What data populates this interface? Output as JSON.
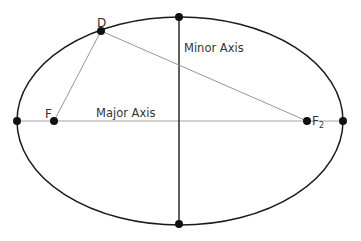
{
  "diagram": {
    "type": "ellipse-geometry",
    "ellipse": {
      "cx": 180,
      "cy": 121,
      "rx": 163,
      "ry": 104,
      "stroke": "#1a1a1a"
    },
    "axes": {
      "major": {
        "label": "Major Axis",
        "x1": 17,
        "y1": 121,
        "x2": 343,
        "y2": 121,
        "stroke": "#999999"
      },
      "minor": {
        "label": "Minor Axis",
        "x1": 179,
        "y1": 17,
        "x2": 179,
        "y2": 224,
        "stroke": "#1a1a1a"
      }
    },
    "points": [
      {
        "id": "vertex-left",
        "x": 17,
        "y": 121,
        "label": ""
      },
      {
        "id": "vertex-right",
        "x": 343,
        "y": 121,
        "label": ""
      },
      {
        "id": "covertex-top",
        "x": 179,
        "y": 17,
        "label": ""
      },
      {
        "id": "covertex-bottom",
        "x": 179,
        "y": 224,
        "label": ""
      },
      {
        "id": "focus-1",
        "x": 54,
        "y": 121,
        "label": "F",
        "subscript": ""
      },
      {
        "id": "focus-2",
        "x": 307,
        "y": 121,
        "label": "F",
        "subscript": "2"
      },
      {
        "id": "point-d",
        "x": 101,
        "y": 31,
        "label": "D"
      }
    ],
    "segments": [
      {
        "from": "point-d",
        "to": "focus-1",
        "stroke": "#888888"
      },
      {
        "from": "point-d",
        "to": "focus-2",
        "stroke": "#888888"
      }
    ],
    "labels": {
      "d": "D",
      "f1": "F",
      "f2": "F",
      "f2_sub": "2",
      "major_axis": "Major Axis",
      "minor_axis": "Minor Axis"
    }
  }
}
